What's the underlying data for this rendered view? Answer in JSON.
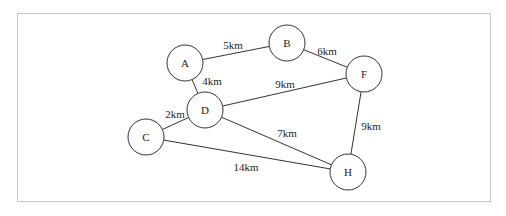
{
  "nodes": [
    {
      "id": "A",
      "label": "A",
      "x": 185,
      "y": 63
    },
    {
      "id": "B",
      "label": "B",
      "x": 287,
      "y": 43
    },
    {
      "id": "F",
      "label": "F",
      "x": 364,
      "y": 74
    },
    {
      "id": "D",
      "label": "D",
      "x": 205,
      "y": 110
    },
    {
      "id": "C",
      "label": "C",
      "x": 146,
      "y": 137
    },
    {
      "id": "H",
      "label": "H",
      "x": 348,
      "y": 172
    }
  ],
  "edges": [
    {
      "from": "A",
      "to": "B",
      "label": "5km",
      "lx": 233,
      "ly": 49
    },
    {
      "from": "B",
      "to": "F",
      "label": "6km",
      "lx": 327,
      "ly": 55
    },
    {
      "from": "A",
      "to": "D",
      "label": "4km",
      "lx": 212,
      "ly": 85
    },
    {
      "from": "D",
      "to": "F",
      "label": "9km",
      "lx": 285,
      "ly": 88
    },
    {
      "from": "C",
      "to": "D",
      "label": "2km",
      "lx": 175,
      "ly": 118
    },
    {
      "from": "D",
      "to": "H",
      "label": "7km",
      "lx": 287,
      "ly": 137
    },
    {
      "from": "F",
      "to": "H",
      "label": "9km",
      "lx": 371,
      "ly": 130
    },
    {
      "from": "C",
      "to": "H",
      "label": "14km",
      "lx": 246,
      "ly": 171
    }
  ],
  "node_radius": 18
}
